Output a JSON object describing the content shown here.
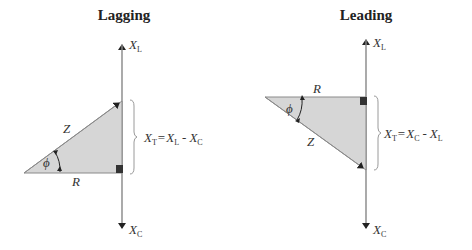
{
  "panels": [
    {
      "title": "Lagging",
      "axis_top": {
        "main": "X",
        "sub": "L"
      },
      "axis_bottom": {
        "main": "X",
        "sub": "C"
      },
      "hyp_label": "Z",
      "adj_label": "R",
      "angle_label": "ϕ",
      "equation": {
        "lhs_main": "X",
        "lhs_sub": "T",
        "eq": "=",
        "a_main": "X",
        "a_sub": "L",
        "op": "-",
        "b_main": "X",
        "b_sub": "C"
      }
    },
    {
      "title": "Leading",
      "axis_top": {
        "main": "X",
        "sub": "L"
      },
      "axis_bottom": {
        "main": "X",
        "sub": "C"
      },
      "hyp_label": "Z",
      "adj_label": "R",
      "angle_label": "ϕ",
      "equation": {
        "lhs_main": "X",
        "lhs_sub": "T",
        "eq": "=",
        "a_main": "X",
        "a_sub": "C",
        "op": "-",
        "b_main": "X",
        "b_sub": "L"
      }
    }
  ],
  "colors": {
    "triangle_fill": "#d6d6d6",
    "axis": "#9a9a9a",
    "edge": "#8a8a8a",
    "arrow": "#222222",
    "right_angle": "#333333"
  }
}
